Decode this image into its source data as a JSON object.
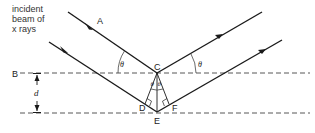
{
  "diagram": {
    "caption_lines": [
      "incident",
      "beam of",
      "x rays"
    ],
    "points": {
      "A": "A",
      "B": "B",
      "C": "C",
      "D": "D",
      "E": "E",
      "F": "F"
    },
    "angle_symbol": "θ",
    "spacing_label": "d",
    "colors": {
      "line": "#1a1a1a",
      "dashed": "#444444",
      "background": "#ffffff"
    }
  }
}
